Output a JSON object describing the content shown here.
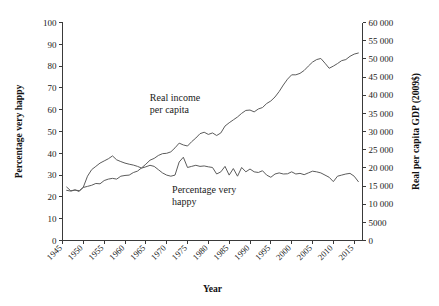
{
  "chart_data": {
    "type": "line",
    "title": "",
    "xlabel": "Year",
    "ylabel": "Percentage very happy",
    "y2label": "Real per capita GDP (2009$)",
    "grid": false,
    "legend_position": "inline-annotations",
    "xlim": [
      1945,
      2017
    ],
    "ylim": [
      0,
      100
    ],
    "y2lim": [
      0,
      60000
    ],
    "xticks": [
      "1945",
      "1950",
      "1955",
      "1960",
      "1965",
      "1970",
      "1975",
      "1980",
      "1985",
      "1990",
      "1995",
      "2000",
      "2005",
      "2010",
      "2015"
    ],
    "yticks": [
      "0",
      "10",
      "20",
      "30",
      "40",
      "50",
      "60",
      "70",
      "80",
      "90",
      "100"
    ],
    "y2ticks": [
      "0",
      "5000",
      "10 000",
      "15 000",
      "20 000",
      "25 000",
      "30 000",
      "35 000",
      "40 000",
      "45 000",
      "50 000",
      "55 000",
      "60 000"
    ],
    "annotations": [
      {
        "text_line1": "Real income",
        "text_line2": "per capita",
        "x": 1972,
        "y": 64
      },
      {
        "text_line1": "Percentage very",
        "text_line2": "happy",
        "x": 1979,
        "y": 22
      }
    ],
    "series": [
      {
        "name": "Percentage very happy",
        "axis": "left",
        "units": "percent",
        "color": "#5c5c5c",
        "x": [
          1946,
          1947,
          1948,
          1949,
          1950,
          1951,
          1952,
          1953,
          1954,
          1955,
          1956,
          1957,
          1958,
          1959,
          1960,
          1961,
          1962,
          1963,
          1964,
          1965,
          1966,
          1967,
          1968,
          1969,
          1970,
          1971,
          1972,
          1973,
          1974,
          1975,
          1976,
          1977,
          1978,
          1979,
          1980,
          1981,
          1982,
          1983,
          1984,
          1985,
          1986,
          1987,
          1988,
          1989,
          1990,
          1991,
          1992,
          1993,
          1994,
          1995,
          1996,
          1997,
          1998,
          1999,
          2000,
          2001,
          2002,
          2003,
          2004,
          2005,
          2006,
          2007,
          2008,
          2009,
          2010,
          2011,
          2012,
          2013,
          2014,
          2015,
          2016
        ],
        "values": [
          24.5,
          22.8,
          23.2,
          22.5,
          24.5,
          29.5,
          32.5,
          34.0,
          35.5,
          36.5,
          37.5,
          38.8,
          37.0,
          36.2,
          35.5,
          35.0,
          34.6,
          34.0,
          33.2,
          33.8,
          34.5,
          34.0,
          32.5,
          31.0,
          30.0,
          29.5,
          30.0,
          36.0,
          38.2,
          33.5,
          34.0,
          34.5,
          34.0,
          34.2,
          33.8,
          33.5,
          30.5,
          31.5,
          34.0,
          30.0,
          33.0,
          29.5,
          33.5,
          31.5,
          32.8,
          31.5,
          31.2,
          32.0,
          30.0,
          29.0,
          30.5,
          31.0,
          30.5,
          30.6,
          31.5,
          30.5,
          30.8,
          30.2,
          31.0,
          31.8,
          31.5,
          31.0,
          30.0,
          29.0,
          27.0,
          29.5,
          30.0,
          30.5,
          30.8,
          29.5,
          27.0
        ]
      },
      {
        "name": "Real income per capita",
        "axis": "right",
        "units": "2009 dollars",
        "color": "#5c5c5c",
        "x": [
          1946,
          1947,
          1948,
          1949,
          1950,
          1951,
          1952,
          1953,
          1954,
          1955,
          1956,
          1957,
          1958,
          1959,
          1960,
          1961,
          1962,
          1963,
          1964,
          1965,
          1966,
          1967,
          1968,
          1969,
          1970,
          1971,
          1972,
          1973,
          1974,
          1975,
          1976,
          1977,
          1978,
          1979,
          1980,
          1981,
          1982,
          1983,
          1984,
          1985,
          1986,
          1987,
          1988,
          1989,
          1990,
          1991,
          1992,
          1993,
          1994,
          1995,
          1996,
          1997,
          1998,
          1999,
          2000,
          2001,
          2002,
          2003,
          2004,
          2005,
          2006,
          2007,
          2008,
          2009,
          2010,
          2011,
          2012,
          2013,
          2014,
          2015,
          2016
        ],
        "values": [
          13800,
          13600,
          13900,
          13700,
          14600,
          14900,
          15200,
          15700,
          15600,
          16500,
          16900,
          17100,
          16900,
          17700,
          17900,
          18000,
          18700,
          19100,
          20000,
          21000,
          22100,
          22600,
          23400,
          23900,
          24000,
          24400,
          25500,
          26800,
          26300,
          26000,
          27200,
          28200,
          29400,
          29800,
          29200,
          29600,
          28900,
          29600,
          31500,
          32400,
          33200,
          34000,
          35000,
          35800,
          35900,
          35400,
          36200,
          36600,
          37700,
          38400,
          39500,
          41000,
          42800,
          44400,
          45600,
          45600,
          46000,
          46800,
          48000,
          49100,
          49800,
          50100,
          48800,
          47400,
          48000,
          48700,
          49500,
          49800,
          50700,
          51300,
          51600
        ]
      }
    ]
  }
}
